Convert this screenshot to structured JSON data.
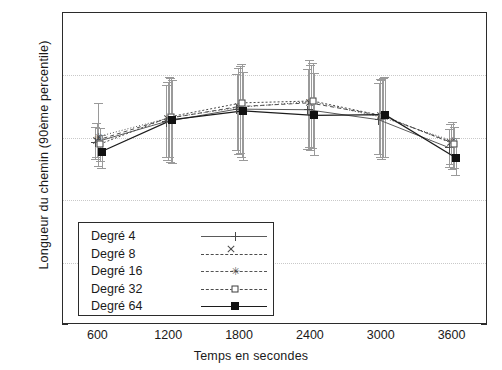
{
  "chart_data": {
    "type": "line",
    "title": "",
    "xlabel": "Temps en secondes",
    "ylabel": "Longueur du chemin (90ème percentile)",
    "x": [
      600,
      1200,
      1800,
      2400,
      3000,
      3600
    ],
    "xtick_labels": [
      "600",
      "1200",
      "1800",
      "2400",
      "3000",
      "3600"
    ],
    "ytick_labels": [
      "0",
      "10",
      "20",
      "30",
      "40",
      "50"
    ],
    "ytick_values": [
      0,
      10,
      20,
      30,
      40,
      50
    ],
    "xlim": [
      300,
      3900
    ],
    "ylim": [
      0,
      50
    ],
    "grid": "horizontal-dotted",
    "legend_position": "inside-lower-left",
    "series": [
      {
        "name": "Degré 4",
        "marker": "plus",
        "values": [
          29.3,
          32.6,
          34.6,
          34.5,
          32.9,
          28.4
        ],
        "err_low": [
          26.6,
          27.0,
          28.0,
          28.2,
          27.4,
          25.4
        ],
        "err_high": [
          31.8,
          38.5,
          40.3,
          41.0,
          38.8,
          31.4
        ]
      },
      {
        "name": "Degré 8",
        "marker": "cross",
        "values": [
          29.6,
          33.1,
          35.0,
          35.6,
          33.6,
          29.3
        ],
        "err_low": [
          26.9,
          26.5,
          27.4,
          28.6,
          27.0,
          25.8
        ],
        "err_high": [
          32.3,
          39.0,
          41.2,
          42.4,
          39.5,
          32.2
        ]
      },
      {
        "name": "Degré 16",
        "marker": "star",
        "values": [
          30.2,
          33.2,
          34.9,
          35.8,
          33.3,
          29.5
        ],
        "err_low": [
          25.5,
          26.9,
          27.6,
          28.0,
          26.6,
          25.0
        ],
        "err_high": [
          35.6,
          39.8,
          41.5,
          41.6,
          39.2,
          32.5
        ]
      },
      {
        "name": "Degré 32",
        "marker": "square-open",
        "values": [
          29.0,
          33.4,
          35.6,
          35.9,
          33.5,
          29.0
        ],
        "err_low": [
          26.3,
          26.2,
          27.0,
          28.4,
          26.9,
          25.2
        ],
        "err_high": [
          31.5,
          39.6,
          41.8,
          42.0,
          39.6,
          31.8
        ]
      },
      {
        "name": "Degré 64",
        "marker": "square-filled",
        "values": [
          27.8,
          32.9,
          34.3,
          33.6,
          33.7,
          26.8
        ],
        "err_low": [
          25.1,
          26.0,
          26.4,
          27.2,
          27.0,
          24.1
        ],
        "err_high": [
          30.4,
          39.2,
          40.5,
          40.4,
          39.8,
          29.9
        ]
      }
    ]
  }
}
